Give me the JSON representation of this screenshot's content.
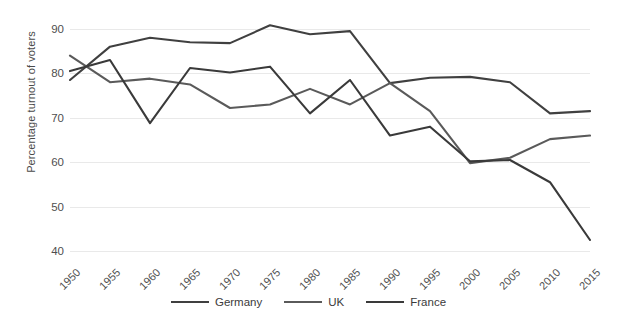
{
  "chart_data": {
    "type": "line",
    "title": "",
    "xlabel": "",
    "ylabel": "Percentage turnout of voters",
    "x": [
      1950,
      1955,
      1960,
      1965,
      1970,
      1975,
      1980,
      1985,
      1990,
      1995,
      2000,
      2005,
      2010,
      2015
    ],
    "xtick_labels": [
      "1950",
      "1955",
      "1960",
      "1965",
      "1970",
      "1975",
      "1980",
      "1985",
      "1990",
      "1995",
      "2000",
      "2005",
      "2010",
      "2015"
    ],
    "ytick_labels": [
      "40",
      "50",
      "60",
      "70",
      "80",
      "90"
    ],
    "yticks": [
      40,
      50,
      60,
      70,
      80,
      90
    ],
    "ylim": [
      38,
      92
    ],
    "grid": true,
    "legend_position": "bottom",
    "series": [
      {
        "name": "Germany",
        "color": "#404040",
        "values": [
          78.5,
          86.0,
          88.0,
          87.0,
          86.8,
          90.8,
          88.8,
          89.5,
          77.8,
          79.0,
          79.2,
          78.0,
          71.0,
          71.5
        ]
      },
      {
        "name": "UK",
        "color": "#5a5a5a",
        "values": [
          84.0,
          78.0,
          78.8,
          77.5,
          72.2,
          73.0,
          76.5,
          73.0,
          77.8,
          71.5,
          59.8,
          61.0,
          65.2,
          66.0
        ]
      },
      {
        "name": "France",
        "color": "#3a3a3a",
        "values": [
          80.5,
          83.0,
          68.8,
          81.2,
          80.2,
          81.5,
          71.0,
          78.5,
          66.0,
          68.0,
          60.2,
          60.5,
          55.5,
          42.5
        ]
      }
    ]
  },
  "legend": {
    "items": [
      {
        "label": "Germany"
      },
      {
        "label": "UK"
      },
      {
        "label": "France"
      }
    ]
  }
}
